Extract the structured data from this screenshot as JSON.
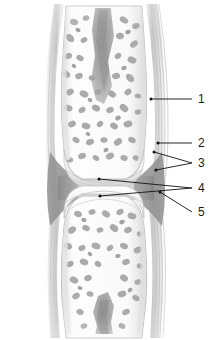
{
  "figure": {
    "style": "grayscale-halftone-illustration",
    "background_color": "#ffffff",
    "width": 222,
    "height": 340
  },
  "palette": {
    "background": "#ffffff",
    "bone_fill": "#fbfbfb",
    "bone_edge": "#b9b9b9",
    "trabecula": "#a6a6a6",
    "trabecula_dark": "#8d8d8d",
    "marrow_cavity": "#9a9a9a",
    "cortical_line": "#c9c9c9",
    "capsule_outer": "#cfcfcf",
    "capsule_mid": "#bdbdbd",
    "synovial_shadow": "#8a8a8a",
    "cartilage": "#f2f2f2",
    "joint_cavity": "#9e9e9e",
    "leader_line": "#111111",
    "label_text": "#1a1a1a"
  },
  "structures": [
    {
      "id": "upper-bone",
      "name": "upper-epiphysis",
      "description": "Upper bone end, flared distally, filled with spongy trabecular bone"
    },
    {
      "id": "lower-bone",
      "name": "lower-epiphysis",
      "description": "Lower bone end, wide at joint then tapering into shaft"
    },
    {
      "id": "upper-marrow",
      "name": "upper-marrow-cavity",
      "description": "Dark medullary cavity extending down into upper bone"
    },
    {
      "id": "lower-marrow",
      "name": "lower-marrow-cavity",
      "description": "Dark medullary cavity extending up into lower bone shaft"
    },
    {
      "id": "joint-space",
      "name": "joint-cavity",
      "description": "Dark synovial cavity between opposing cartilage surfaces"
    },
    {
      "id": "capsule",
      "name": "articular-capsule",
      "description": "Layered fibrous sheath running along both lateral margins"
    }
  ],
  "labels": [
    {
      "id": "label-1",
      "number": "1",
      "text_x": 198,
      "text_y": 94,
      "leader": {
        "type": "straight",
        "from_x": 192,
        "from_y": 99,
        "to_x": 151,
        "to_y": 99,
        "dot": true,
        "dot_x": 151,
        "dot_y": 99
      }
    },
    {
      "id": "label-2",
      "number": "2",
      "text_x": 198,
      "text_y": 138,
      "leader": {
        "type": "straight",
        "from_x": 192,
        "from_y": 143,
        "to_x": 158,
        "to_y": 143,
        "dot": true,
        "dot_x": 158,
        "dot_y": 143
      }
    },
    {
      "id": "label-3",
      "number": "3",
      "text_x": 198,
      "text_y": 158,
      "leader": {
        "type": "fork",
        "from_x": 192,
        "from_y": 163,
        "branches": [
          {
            "to_x": 154,
            "to_y": 152,
            "dot": true
          },
          {
            "to_x": 156,
            "to_y": 170,
            "dot": true
          }
        ]
      }
    },
    {
      "id": "label-4",
      "number": "4",
      "text_x": 198,
      "text_y": 183,
      "leader": {
        "type": "fork",
        "from_x": 192,
        "from_y": 188,
        "branches": [
          {
            "to_x": 99,
            "to_y": 179,
            "dot": true
          },
          {
            "to_x": 100,
            "to_y": 196,
            "dot": true
          }
        ]
      }
    },
    {
      "id": "label-5",
      "number": "5",
      "text_x": 198,
      "text_y": 207,
      "leader": {
        "type": "diagonal",
        "from_x": 192,
        "from_y": 212,
        "to_x": 160,
        "to_y": 192,
        "dot": true,
        "dot_x": 160,
        "dot_y": 192
      }
    }
  ],
  "label_list": {
    "1": "1",
    "2": "2",
    "3": "3",
    "4": "4",
    "5": "5"
  }
}
